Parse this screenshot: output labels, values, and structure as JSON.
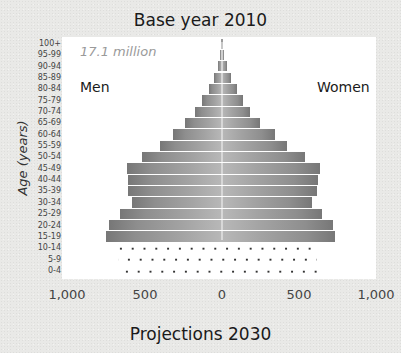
{
  "title": "Base year 2010",
  "subtitle": "Projections 2030",
  "total_label": "17.1 million",
  "left_label": "Men",
  "right_label": "Women",
  "y_axis_label": "Age (years)",
  "x_ticks": [
    "1,000",
    "500",
    "0",
    "500",
    "1,000"
  ],
  "colors": {
    "plot_bg": "#ffffff",
    "page_bg": "#e9e9e7",
    "bar_light": "#b8b8b8",
    "bar_dark": "#777777",
    "projection_dots": "#333333"
  },
  "chart_data": {
    "type": "bar",
    "orientation": "horizontal",
    "style": "population-pyramid",
    "title": "Base year 2010",
    "subtitle": "Projections 2030",
    "annotation": "17.1 million",
    "xlabel": "",
    "ylabel": "Age (years)",
    "x_tick_labels": [
      "1,000",
      "500",
      "0",
      "500",
      "1,000"
    ],
    "xlim": [
      -1000,
      1000
    ],
    "grid": false,
    "categories": [
      "100+",
      "95-99",
      "90-94",
      "85-89",
      "80-84",
      "75-79",
      "70-74",
      "65-69",
      "60-64",
      "55-59",
      "50-54",
      "45-49",
      "40-44",
      "35-39",
      "30-34",
      "25-29",
      "20-24",
      "15-19",
      "10-14",
      "5-9",
      "0-4"
    ],
    "series": [
      {
        "name": "Men",
        "values": [
          5,
          10,
          25,
          55,
          85,
          130,
          175,
          240,
          320,
          405,
          520,
          620,
          615,
          615,
          590,
          665,
          740,
          760,
          null,
          null,
          null
        ]
      },
      {
        "name": "Women",
        "values": [
          5,
          12,
          30,
          60,
          95,
          140,
          185,
          250,
          345,
          425,
          545,
          640,
          630,
          620,
          590,
          655,
          725,
          740,
          null,
          null,
          null
        ]
      },
      {
        "name": "Projections 2030 (dotted)",
        "categories": [
          "10-14",
          "5-9",
          "0-4"
        ],
        "men": [
          700,
          680,
          660
        ],
        "women": [
          640,
          620,
          620
        ]
      }
    ]
  }
}
